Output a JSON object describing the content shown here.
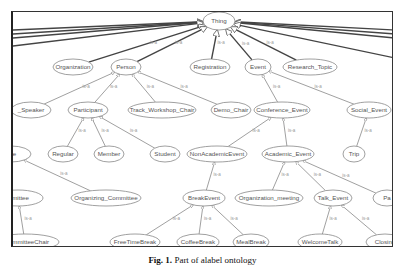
{
  "diagram": {
    "root": "Thing",
    "edge_label": "is-a",
    "nodes": [
      {
        "id": "thing",
        "label": "Thing",
        "x": 206,
        "y": 9,
        "rx": 16,
        "ry": 9
      },
      {
        "id": "organization",
        "label": "Organization",
        "x": 60,
        "y": 55,
        "rx": 20,
        "ry": 8
      },
      {
        "id": "person",
        "label": "Person",
        "x": 113,
        "y": 55,
        "rx": 15,
        "ry": 8
      },
      {
        "id": "registration",
        "label": "Registration",
        "x": 197,
        "y": 55,
        "rx": 20,
        "ry": 8
      },
      {
        "id": "event",
        "label": "Event",
        "x": 245,
        "y": 55,
        "rx": 13,
        "ry": 8
      },
      {
        "id": "research_topic",
        "label": "Research_Topic",
        "x": 297,
        "y": 55,
        "rx": 27,
        "ry": 8
      },
      {
        "id": "speaker",
        "label": "_Speaker",
        "x": 18,
        "y": 98,
        "rx": 20,
        "ry": 8
      },
      {
        "id": "participant",
        "label": "Participant",
        "x": 75,
        "y": 98,
        "rx": 20,
        "ry": 8
      },
      {
        "id": "track_workshop_chair",
        "label": "Track_Workshop_Chair",
        "x": 149,
        "y": 98,
        "rx": 34,
        "ry": 8
      },
      {
        "id": "demo_chair",
        "label": "Demo_Chair",
        "x": 218,
        "y": 98,
        "rx": 20,
        "ry": 8
      },
      {
        "id": "conference_event",
        "label": "Conference_Event",
        "x": 269,
        "y": 98,
        "rx": 28,
        "ry": 8
      },
      {
        "id": "social_event",
        "label": "Social_Event",
        "x": 356,
        "y": 98,
        "rx": 22,
        "ry": 8
      },
      {
        "id": "regular",
        "label": "Regular",
        "x": 50,
        "y": 142,
        "rx": 15,
        "ry": 8
      },
      {
        "id": "member",
        "label": "Member",
        "x": 96,
        "y": 142,
        "rx": 15,
        "ry": 8
      },
      {
        "id": "student",
        "label": "Student",
        "x": 152,
        "y": 142,
        "rx": 15,
        "ry": 8
      },
      {
        "id": "non_academic_event",
        "label": "NonAcademicEvent",
        "x": 204,
        "y": 142,
        "rx": 30,
        "ry": 8
      },
      {
        "id": "academic_event",
        "label": "Academic_Event",
        "x": 275,
        "y": 142,
        "rx": 26,
        "ry": 8
      },
      {
        "id": "trip",
        "label": "Trip",
        "x": 341,
        "y": 142,
        "rx": 11,
        "ry": 8
      },
      {
        "id": "committee",
        "label": "ttee",
        "x": -2,
        "y": 142,
        "rx": 20,
        "ry": 8
      },
      {
        "id": "program_committee",
        "label": "mmittee",
        "x": 5,
        "y": 186,
        "rx": 25,
        "ry": 8
      },
      {
        "id": "organizing_committee",
        "label": "Organizing_Committee",
        "x": 93,
        "y": 186,
        "rx": 35,
        "ry": 8
      },
      {
        "id": "break_event",
        "label": "BreakEvent",
        "x": 191,
        "y": 186,
        "rx": 21,
        "ry": 8
      },
      {
        "id": "organization_meeting",
        "label": "Organization_meeting",
        "x": 256,
        "y": 186,
        "rx": 34,
        "ry": 8
      },
      {
        "id": "talk_event",
        "label": "Talk_Event",
        "x": 320,
        "y": 186,
        "rx": 19,
        "ry": 8
      },
      {
        "id": "panel",
        "label": "Pa",
        "x": 374,
        "y": 186,
        "rx": 14,
        "ry": 8
      },
      {
        "id": "committee_chair",
        "label": "nCommitteeChair",
        "x": 12,
        "y": 230,
        "rx": 34,
        "ry": 8
      },
      {
        "id": "free_time_break",
        "label": "FreeTimeBreak",
        "x": 122,
        "y": 230,
        "rx": 25,
        "ry": 8
      },
      {
        "id": "coffee_break",
        "label": "CoffeeBreak",
        "x": 185,
        "y": 230,
        "rx": 21,
        "ry": 8
      },
      {
        "id": "meal_break",
        "label": "MealBreak",
        "x": 238,
        "y": 230,
        "rx": 18,
        "ry": 8
      },
      {
        "id": "welcome_talk",
        "label": "WelcomeTalk",
        "x": 307,
        "y": 230,
        "rx": 22,
        "ry": 8
      },
      {
        "id": "closing",
        "label": "Closing",
        "x": 372,
        "y": 230,
        "rx": 19,
        "ry": 8
      }
    ],
    "edges": [
      {
        "from": "organization",
        "to": "thing",
        "dark": true
      },
      {
        "from": "person",
        "to": "thing",
        "dark": true
      },
      {
        "from": "registration",
        "to": "thing",
        "dark": true
      },
      {
        "from": "event",
        "to": "thing",
        "dark": true
      },
      {
        "from": "research_topic",
        "to": "thing",
        "dark": true
      },
      {
        "from": "speaker",
        "to": "person"
      },
      {
        "from": "participant",
        "to": "person"
      },
      {
        "from": "track_workshop_chair",
        "to": "person"
      },
      {
        "from": "demo_chair",
        "to": "person"
      },
      {
        "from": "conference_event",
        "to": "event"
      },
      {
        "from": "social_event",
        "to": "event"
      },
      {
        "from": "regular",
        "to": "participant"
      },
      {
        "from": "member",
        "to": "participant"
      },
      {
        "from": "student",
        "to": "participant"
      },
      {
        "from": "non_academic_event",
        "to": "conference_event"
      },
      {
        "from": "academic_event",
        "to": "conference_event"
      },
      {
        "from": "trip",
        "to": "social_event"
      },
      {
        "from": "organizing_committee",
        "to": "committee"
      },
      {
        "from": "committee_chair",
        "to": "program_committee"
      },
      {
        "from": "break_event",
        "to": "non_academic_event"
      },
      {
        "from": "organization_meeting",
        "to": "academic_event"
      },
      {
        "from": "talk_event",
        "to": "academic_event"
      },
      {
        "from": "panel",
        "to": "academic_event"
      },
      {
        "from": "free_time_break",
        "to": "break_event"
      },
      {
        "from": "coffee_break",
        "to": "break_event"
      },
      {
        "from": "meal_break",
        "to": "break_event"
      },
      {
        "from": "welcome_talk",
        "to": "talk_event"
      },
      {
        "from": "closing",
        "to": "talk_event"
      }
    ],
    "offscreen_edges_to_thing": [
      {
        "x": 0,
        "y": 18
      },
      {
        "x": 0,
        "y": 22
      },
      {
        "x": 0,
        "y": 26
      },
      {
        "x": 0,
        "y": 34
      },
      {
        "x": 382,
        "y": 18
      },
      {
        "x": 382,
        "y": 22
      },
      {
        "x": 382,
        "y": 26
      },
      {
        "x": 382,
        "y": 46
      }
    ]
  },
  "caption": {
    "label": "Fig. 1.",
    "text": " Part of alabel ontology"
  }
}
